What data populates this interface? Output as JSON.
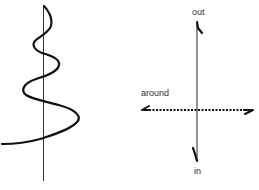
{
  "diagram": {
    "left_figure": {
      "description": "spiral winding around a vertical axis, widening toward the bottom",
      "axis": {
        "x": 43,
        "y_top": 5,
        "y_bottom": 180
      }
    },
    "right_figure": {
      "description": "axes with vertical out/in arrow and horizontal dotted bidirectional around arrow",
      "labels": {
        "out": "out",
        "around": "around",
        "in": "in"
      }
    },
    "colors": {
      "ink": "#111111",
      "text": "#333333",
      "background": "#ffffff"
    }
  }
}
